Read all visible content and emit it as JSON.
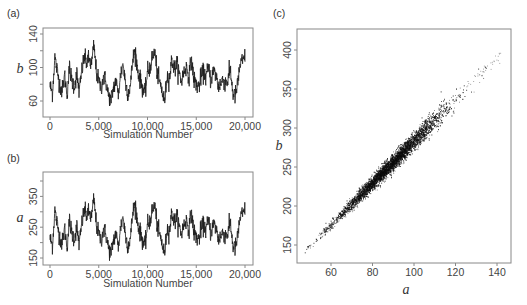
{
  "chart_data": [
    {
      "panel": "(a)",
      "type": "line",
      "title": "",
      "xlabel": "Simulation Number",
      "ylabel": "b",
      "xlim": [
        0,
        20000
      ],
      "ylim": [
        52,
        144
      ],
      "x_ticks": [
        0,
        5000,
        10000,
        15000,
        20000
      ],
      "x_tick_labels": [
        "0",
        "5,000",
        "10,000",
        "15,000",
        "20,000"
      ],
      "y_ticks": [
        60,
        80,
        100,
        120,
        140
      ],
      "y_tick_labels": [
        "60",
        "",
        "100",
        "",
        "140"
      ],
      "grid": false,
      "step": 250,
      "values": [
        78,
        70,
        112,
        95,
        80,
        72,
        90,
        68,
        100,
        84,
        78,
        92,
        70,
        95,
        112,
        106,
        110,
        103,
        126,
        96,
        82,
        76,
        90,
        82,
        66,
        60,
        75,
        85,
        68,
        92,
        105,
        80,
        70,
        78,
        110,
        120,
        96,
        85,
        76,
        68,
        95,
        100,
        112,
        120,
        92,
        82,
        72,
        58,
        90,
        86,
        110,
        98,
        104,
        92,
        84,
        96,
        100,
        90,
        110,
        86,
        80,
        76,
        90,
        94,
        88,
        100,
        84,
        96,
        92,
        78,
        80,
        86,
        82,
        84,
        98,
        70,
        66,
        80,
        104,
        108,
        112,
        80,
        88,
        100,
        98,
        90,
        100,
        82,
        78,
        70,
        66,
        82,
        104,
        116,
        110,
        94,
        92,
        84,
        72,
        64,
        70,
        96,
        88,
        100,
        108,
        102,
        96,
        88,
        100,
        90,
        96,
        108,
        92,
        86,
        104,
        110,
        115,
        120,
        112,
        110,
        108,
        118,
        102,
        96,
        110,
        98,
        80,
        92,
        84,
        70,
        62,
        66,
        76,
        90,
        84,
        72,
        62,
        70,
        60,
        74,
        56
      ]
    },
    {
      "panel": "(b)",
      "type": "line",
      "title": "",
      "xlabel": "Simulation Number",
      "ylabel": "a",
      "xlim": [
        0,
        20000
      ],
      "ylim": [
        125,
        430
      ],
      "x_ticks": [
        0,
        5000,
        10000,
        15000,
        20000
      ],
      "x_tick_labels": [
        "0",
        "5,000",
        "10,000",
        "15,000",
        "20,000"
      ],
      "y_ticks": [
        150,
        200,
        250,
        300,
        350,
        400
      ],
      "y_tick_labels": [
        "150",
        "",
        "250",
        "",
        "350",
        ""
      ],
      "grid": false,
      "note": "series is approximately a linear transform of panel (a): a ≈ 2.67·b + 5"
    },
    {
      "panel": "(c)",
      "type": "scatter",
      "title": "",
      "xlabel": "a",
      "ylabel": "b",
      "xlim": [
        45,
        147
      ],
      "ylim": [
        127,
        425
      ],
      "x_ticks": [
        60,
        80,
        100,
        120,
        140
      ],
      "x_tick_labels": [
        "60",
        "80",
        "100",
        "120",
        "140"
      ],
      "y_ticks": [
        150,
        200,
        250,
        300,
        350,
        400
      ],
      "y_tick_labels": [
        "150",
        "200",
        "250",
        "300",
        "350",
        "400"
      ],
      "grid": false,
      "relationship": {
        "slope": 2.68,
        "intercept": 15,
        "x_range": [
          48,
          143
        ],
        "n_points": 20000
      },
      "note": "Axis labels as printed: horizontal axis 'a' spans 60–140, vertical axis 'b' spans 150–400"
    }
  ],
  "labels": {
    "panel_a": "(a)",
    "panel_b": "(b)",
    "panel_c": "(c)",
    "xlabel_a": "Simulation Number",
    "xlabel_b": "Simulation Number",
    "ylabel_a": "b",
    "ylabel_b": "a",
    "xlabel_c": "a",
    "ylabel_c": "b"
  }
}
